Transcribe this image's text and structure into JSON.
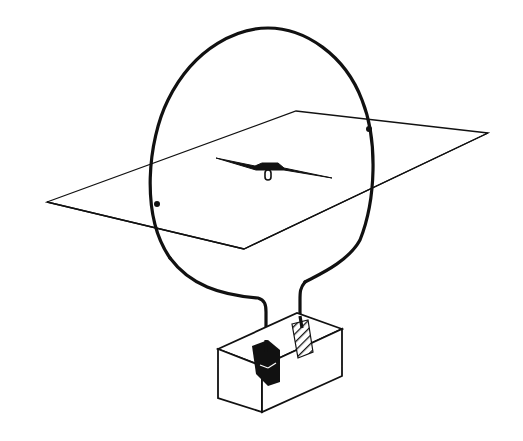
{
  "figure": {
    "colors": {
      "background": "#ffffff",
      "ink": "#111111"
    },
    "plane": {
      "points": [
        [
          47,
          202
        ],
        [
          296,
          111
        ],
        [
          488,
          133
        ],
        [
          244,
          249
        ]
      ]
    },
    "loop": {
      "cx": 263,
      "cy": 170,
      "rx": 110,
      "ry": 142
    },
    "needle": {
      "x1": 216,
      "y1": 158,
      "x2": 332,
      "y2": 178,
      "pivot": [
        270,
        170
      ]
    },
    "battery_box": {
      "front_face": [
        [
          218,
          349
        ],
        [
          262,
          366
        ],
        [
          262,
          412
        ],
        [
          218,
          398
        ]
      ],
      "side_face": [
        [
          262,
          366
        ],
        [
          342,
          329
        ],
        [
          342,
          376
        ],
        [
          262,
          412
        ]
      ],
      "top_face": [
        [
          218,
          349
        ],
        [
          297,
          313
        ],
        [
          342,
          329
        ],
        [
          262,
          366
        ]
      ],
      "terminal_negative": "black",
      "terminal_positive": "hatched"
    }
  }
}
